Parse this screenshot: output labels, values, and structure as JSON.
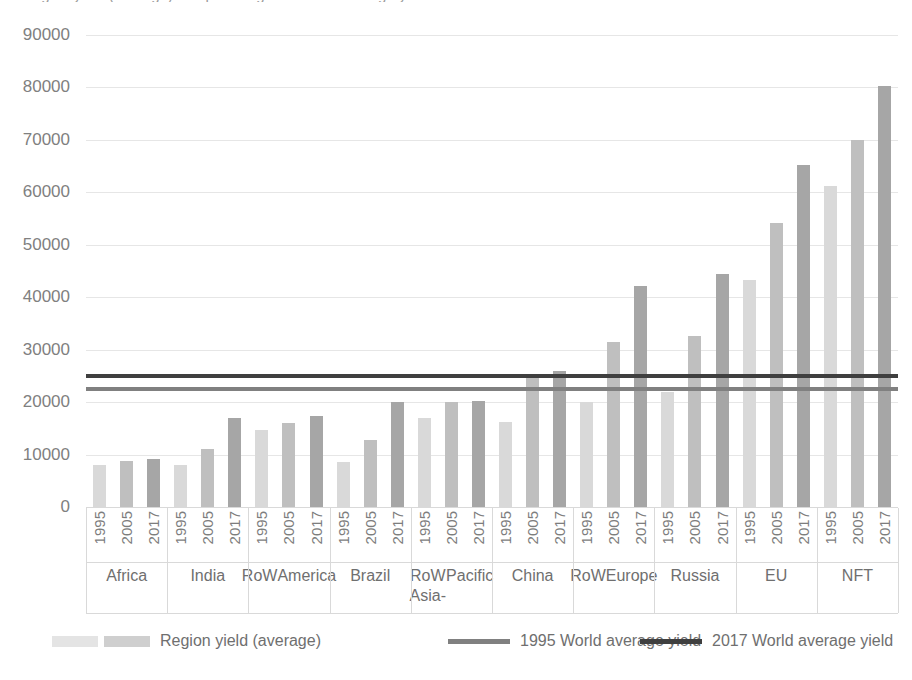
{
  "chart_data": {
    "type": "bar",
    "title": "Region yield (average) compared against world average yield",
    "xlabel": "",
    "ylabel": "",
    "ylim": [
      0,
      90000
    ],
    "ytick_values": [
      0,
      10000,
      20000,
      30000,
      40000,
      50000,
      60000,
      70000,
      80000,
      90000
    ],
    "ytick_labels": [
      "0",
      "10000",
      "20000",
      "30000",
      "40000",
      "50000",
      "60000",
      "70000",
      "80000",
      "90000"
    ],
    "grid": true,
    "legend_position": "bottom",
    "years": [
      "1995",
      "2005",
      "2017"
    ],
    "categories": [
      "Africa",
      "India",
      "RoW America",
      "Brazil",
      "RoW Asia-Pacific",
      "China",
      "RoW Europe",
      "Russia",
      "EU",
      "NFT"
    ],
    "category_lines": [
      [
        "Africa"
      ],
      [
        "India"
      ],
      [
        "RoW",
        "America"
      ],
      [
        "Brazil"
      ],
      [
        "RoW Asia-",
        "Pacific"
      ],
      [
        "China"
      ],
      [
        "RoW",
        "Europe"
      ],
      [
        "Russia"
      ],
      [
        "EU"
      ],
      [
        "NFT"
      ]
    ],
    "series": [
      {
        "name": "1995",
        "values": [
          8000,
          8100,
          14600,
          8500,
          17000,
          16200,
          20100,
          22000,
          43300,
          61200
        ]
      },
      {
        "name": "2005",
        "values": [
          8800,
          11000,
          16100,
          12800,
          20000,
          25000,
          31500,
          32600,
          54200,
          70000
        ]
      },
      {
        "name": "2017",
        "values": [
          9100,
          17000,
          17400,
          20000,
          20300,
          26000,
          42200,
          44500,
          65200,
          80300
        ]
      }
    ],
    "reference_lines": [
      {
        "name": "1995 World average yield",
        "value": 22500,
        "color": "#808080"
      },
      {
        "name": "2017 World average yield",
        "value": 25000,
        "color": "#3f3f3f"
      }
    ],
    "bar_colors": [
      "#d9d9d9",
      "#bfbfbf",
      "#a6a6a6"
    ],
    "legend": [
      {
        "label": "Region yield (average)",
        "type": "swatch-pair"
      },
      {
        "label": "1995 World average yield",
        "type": "line",
        "color": "#808080"
      },
      {
        "label": "2017 World average yield",
        "type": "line",
        "color": "#3f3f3f"
      }
    ]
  }
}
